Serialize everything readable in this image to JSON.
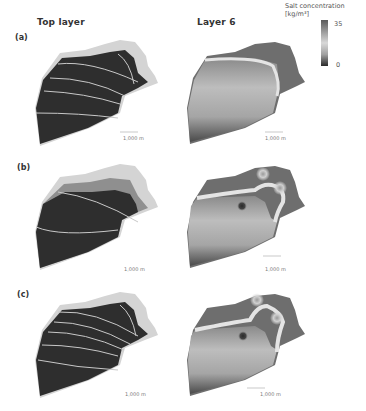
{
  "columns": {
    "left_title": "Top layer",
    "right_title": "Layer 6"
  },
  "legend": {
    "title_line1": "Salt concentration",
    "title_line2": "[kg/m³]",
    "max_label": "35",
    "min_label": "0",
    "colors": [
      "#5a5a5a",
      "#d8d8d8",
      "#2a2a2a"
    ]
  },
  "panels": [
    {
      "label": "(a)",
      "top_layer_contour_count": 5,
      "layer6_freshwater_lenses": 0
    },
    {
      "label": "(b)",
      "top_layer_contour_count": 2,
      "layer6_freshwater_lenses": 3
    },
    {
      "label": "(c)",
      "top_layer_contour_count": 6,
      "layer6_freshwater_lenses": 3
    }
  ],
  "scale_bar_label": "1,000 m",
  "colors": {
    "fresh": "#2e2e2e",
    "saline": "#6e6e6e",
    "transition": "#d4d4d4",
    "contour": "#c8c8c8"
  }
}
